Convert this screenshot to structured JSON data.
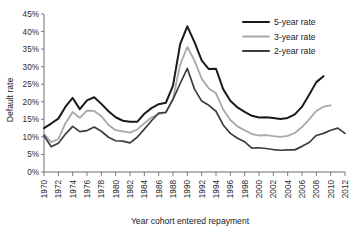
{
  "chart_data": {
    "type": "line",
    "title": "",
    "xlabel": "Year cohort entered repayment",
    "ylabel": "Default rate",
    "xlim": [
      1970,
      2012
    ],
    "ylim": [
      0,
      45
    ],
    "ytick_labels": [
      "0%",
      "5%",
      "10%",
      "15%",
      "20%",
      "25%",
      "30%",
      "35%",
      "40%",
      "45%"
    ],
    "ytick_values": [
      0,
      5,
      10,
      15,
      20,
      25,
      30,
      35,
      40,
      45
    ],
    "xtick_labels": [
      "1970",
      "1972",
      "1974",
      "1976",
      "1978",
      "1980",
      "1982",
      "1984",
      "1986",
      "1988",
      "1990",
      "1992",
      "1994",
      "1996",
      "1998",
      "2000",
      "2002",
      "2004",
      "2006",
      "2008",
      "2010",
      "2012"
    ],
    "xtick_values": [
      1970,
      1972,
      1974,
      1976,
      1978,
      1980,
      1982,
      1984,
      1986,
      1988,
      1990,
      1992,
      1994,
      1996,
      1998,
      2000,
      2002,
      2004,
      2006,
      2008,
      2010,
      2012
    ],
    "grid": false,
    "legend_position": "top-right",
    "series": [
      {
        "name": "5-year rate",
        "color": "#1a1a1a",
        "width": 2.0,
        "x": [
          1970,
          1971,
          1972,
          1973,
          1974,
          1975,
          1976,
          1977,
          1978,
          1979,
          1980,
          1981,
          1982,
          1983,
          1984,
          1985,
          1986,
          1987,
          1988,
          1989,
          1990,
          1991,
          1992,
          1993,
          1994,
          1995,
          1996,
          1997,
          1998,
          1999,
          2000,
          2001,
          2002,
          2003,
          2004,
          2005,
          2006,
          2007,
          2008,
          2009
        ],
        "values": [
          12.5,
          13.8,
          15.2,
          18.6,
          21.1,
          17.9,
          20.4,
          21.3,
          19.4,
          17.3,
          15.6,
          14.6,
          14.3,
          14.3,
          16.6,
          18.2,
          19.3,
          19.7,
          24.6,
          36.4,
          41.5,
          37.0,
          31.8,
          29.3,
          29.4,
          23.6,
          20.3,
          18.4,
          17.1,
          16.0,
          15.5,
          15.6,
          15.4,
          15.1,
          15.4,
          16.4,
          18.6,
          22.0,
          25.6,
          27.3
        ]
      },
      {
        "name": "3-year rate",
        "color": "#a8a8a8",
        "width": 1.8,
        "x": [
          1970,
          1971,
          1972,
          1973,
          1974,
          1975,
          1976,
          1977,
          1978,
          1979,
          1980,
          1981,
          1982,
          1983,
          1984,
          1985,
          1986,
          1987,
          1988,
          1989,
          1990,
          1991,
          1992,
          1993,
          1994,
          1995,
          1996,
          1997,
          1998,
          1999,
          2000,
          2001,
          2002,
          2003,
          2004,
          2005,
          2006,
          2007,
          2008,
          2009,
          2010
        ],
        "values": [
          10.8,
          8.5,
          9.4,
          13.9,
          17.1,
          15.4,
          17.5,
          17.4,
          15.9,
          13.4,
          11.9,
          11.6,
          11.2,
          12.1,
          13.9,
          15.5,
          16.5,
          16.9,
          20.9,
          30.6,
          35.6,
          31.7,
          26.6,
          23.8,
          22.4,
          17.8,
          14.8,
          13.0,
          11.9,
          10.8,
          10.4,
          10.5,
          10.2,
          10.0,
          10.3,
          11.1,
          12.8,
          15.0,
          17.4,
          18.6,
          19.0
        ]
      },
      {
        "name": "2-year rate",
        "color": "#3d3d3d",
        "width": 1.7,
        "x": [
          1970,
          1971,
          1972,
          1973,
          1974,
          1975,
          1976,
          1977,
          1978,
          1979,
          1980,
          1981,
          1982,
          1983,
          1984,
          1985,
          1986,
          1987,
          1988,
          1989,
          1990,
          1991,
          1992,
          1993,
          1994,
          1995,
          1996,
          1997,
          1998,
          1999,
          2000,
          2001,
          2002,
          2003,
          2004,
          2005,
          2006,
          2007,
          2008,
          2009,
          2010,
          2011,
          2012
        ],
        "values": [
          10.4,
          7.2,
          8.2,
          10.8,
          13.0,
          11.5,
          11.8,
          12.8,
          11.6,
          9.9,
          8.9,
          8.8,
          8.3,
          9.9,
          12.2,
          14.6,
          16.8,
          17.0,
          20.7,
          25.2,
          29.5,
          23.6,
          20.2,
          19.0,
          17.3,
          13.4,
          11.0,
          9.6,
          8.6,
          6.8,
          6.9,
          6.7,
          6.4,
          6.2,
          6.3,
          6.3,
          7.3,
          8.4,
          10.4,
          11.0,
          11.9,
          12.5,
          11.0
        ]
      }
    ]
  },
  "legend": {
    "items": [
      {
        "label": "5-year rate",
        "color": "#1a1a1a"
      },
      {
        "label": "3-year rate",
        "color": "#a8a8a8"
      },
      {
        "label": "2-year rate",
        "color": "#3d3d3d"
      }
    ]
  }
}
